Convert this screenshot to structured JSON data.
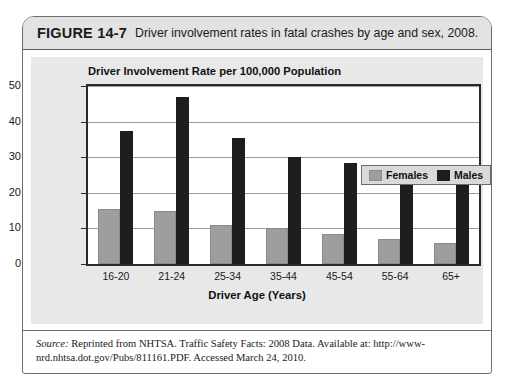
{
  "figure": {
    "number": "FIGURE 14-7",
    "caption": "Driver involvement rates in fatal crashes by age and sex, 2008."
  },
  "source": {
    "label": "Source:",
    "text": " Reprinted from NHTSA. Traffic Safety Facts: 2008 Data. Available at: http://www-nrd.nhtsa.dot.gov/Pubs/811161.PDF. Accessed March 24, 2010."
  },
  "colors": {
    "female": "#9e9e9e",
    "male": "#1d1d1d",
    "panel": "#e8e8e8",
    "header": "#e2e2e2",
    "frame": "#2a2a2a"
  },
  "chart_data": {
    "type": "bar",
    "title": "Driver Involvement Rate per 100,000 Population",
    "xlabel": "Driver Age (Years)",
    "ylabel": "",
    "categories": [
      "16-20",
      "21-24",
      "25-34",
      "35-44",
      "45-54",
      "55-64",
      "65+"
    ],
    "series": [
      {
        "name": "Females",
        "values": [
          15.5,
          15,
          11,
          10,
          8.5,
          7,
          6
        ]
      },
      {
        "name": "Males",
        "values": [
          37.5,
          47,
          35.5,
          30,
          28.5,
          26,
          23
        ]
      }
    ],
    "ylim": [
      0,
      50
    ],
    "yticks": [
      0,
      10,
      20,
      30,
      40,
      50
    ],
    "grid": true,
    "legend_position": "upper-right"
  }
}
